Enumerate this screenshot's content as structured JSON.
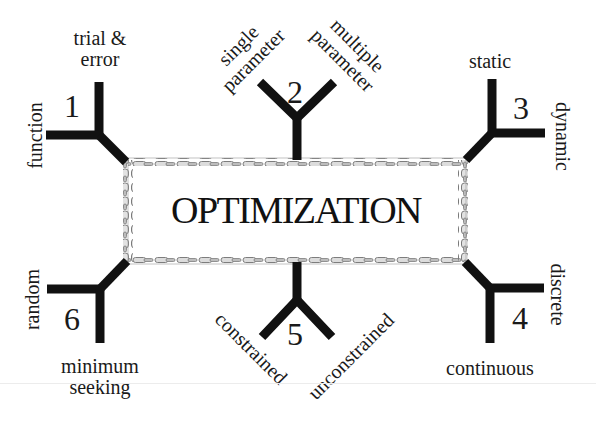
{
  "diagram": {
    "title": "OPTIMIZATION",
    "colors": {
      "branch": "#111111",
      "chain_fill": "#d9d9d9",
      "chain_stroke": "#8a8a8a",
      "text": "#1a1a1a",
      "background": "#ffffff"
    },
    "branches": [
      {
        "number": "1",
        "options": [
          "trial & error",
          "function"
        ],
        "option_lines": [
          [
            "trial &",
            "error"
          ],
          [
            "function"
          ]
        ]
      },
      {
        "number": "2",
        "options": [
          "single parameter",
          "multiple parameter"
        ],
        "option_lines": [
          [
            "single",
            "parameter"
          ],
          [
            "multiple",
            "parameter"
          ]
        ]
      },
      {
        "number": "3",
        "options": [
          "static",
          "dynamic"
        ],
        "option_lines": [
          [
            "static"
          ],
          [
            "dynamic"
          ]
        ]
      },
      {
        "number": "4",
        "options": [
          "discrete",
          "continuous"
        ],
        "option_lines": [
          [
            "discrete"
          ],
          [
            "continuous"
          ]
        ]
      },
      {
        "number": "5",
        "options": [
          "constrained",
          "unconstrained"
        ],
        "option_lines": [
          [
            "constrained"
          ],
          [
            "unconstrained"
          ]
        ]
      },
      {
        "number": "6",
        "options": [
          "random",
          "minimum seeking"
        ],
        "option_lines": [
          [
            "random"
          ],
          [
            "minimum",
            "seeking"
          ]
        ]
      }
    ]
  }
}
